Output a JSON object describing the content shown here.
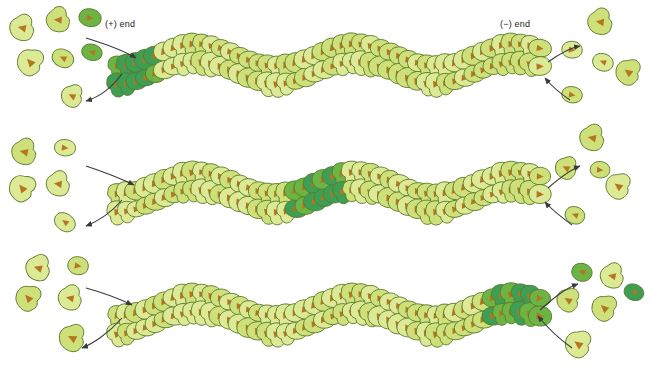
{
  "figure": {
    "type": "biological-process-diagram",
    "panel_count": 3
  },
  "labels": {
    "plus_end": "(+) end",
    "minus_end": "(−) end"
  },
  "colors": {
    "atp_actin_dark": "#3d9e54",
    "atp_actin_mid": "#6cb544",
    "adp_actin_light": "#cde07a",
    "adp_actin_pale": "#dcea96",
    "subunit_outline": "#5c7a2e",
    "barb_arrow": "#b5761f",
    "arrow_stroke": "#3a3a3a",
    "linker": "#9fb6c9",
    "background": "#ffffff",
    "label_text": "#231f20"
  },
  "panels": [
    {
      "id": "panel-1",
      "name": "newly-added-atp-subunits-at-plus-end",
      "y": 12,
      "dark_band": {
        "position": "plus-end",
        "start_index": 0,
        "count": 5
      },
      "filament": {
        "x_start": 118,
        "x_end": 540,
        "subunits": 46
      },
      "left_pool": {
        "name": "free-monomer-pool-left",
        "monomers": [
          {
            "x": 22,
            "y": 28,
            "shape": "pear",
            "state": "adp",
            "rot": 200,
            "s": 1.15
          },
          {
            "x": 58,
            "y": 20,
            "shape": "pear",
            "state": "adp",
            "rot": 190,
            "s": 1.1
          },
          {
            "x": 90,
            "y": 18,
            "shape": "round",
            "state": "atp",
            "rot": 10,
            "s": 0.95
          },
          {
            "x": 30,
            "y": 62,
            "shape": "pear",
            "state": "adp",
            "rot": 235,
            "s": 1.2
          },
          {
            "x": 63,
            "y": 58,
            "shape": "round",
            "state": "adp",
            "rot": 205,
            "s": 0.95
          },
          {
            "x": 92,
            "y": 52,
            "shape": "round",
            "state": "atp",
            "rot": 195,
            "s": 0.9
          },
          {
            "x": 72,
            "y": 96,
            "shape": "pear",
            "state": "adp",
            "rot": 215,
            "s": 1.0
          }
        ]
      },
      "right_pool": {
        "name": "free-monomer-pool-right",
        "monomers": [
          {
            "x": 600,
            "y": 22,
            "shape": "pear",
            "state": "adp",
            "rot": 195,
            "s": 1.15
          },
          {
            "x": 572,
            "y": 50,
            "shape": "round",
            "state": "adp",
            "rot": 5,
            "s": 0.95
          },
          {
            "x": 603,
            "y": 62,
            "shape": "round",
            "state": "adp",
            "rot": 200,
            "s": 0.9
          },
          {
            "x": 628,
            "y": 72,
            "shape": "pear",
            "state": "adp",
            "rot": 225,
            "s": 1.15
          },
          {
            "x": 572,
            "y": 95,
            "shape": "round",
            "state": "adp",
            "rot": 10,
            "s": 0.9
          }
        ]
      },
      "arrows": [
        {
          "name": "association-arrow-plus-end",
          "d": "M86,38 C112,46 126,52 136,58",
          "dir": "in"
        },
        {
          "name": "dissociation-arrow-plus-end",
          "d": "M122,74 C110,90 96,98 86,101",
          "dir": "out"
        },
        {
          "name": "dissociation-arrow-minus-end",
          "d": "M548,62 C562,52 570,48 580,46",
          "dir": "out"
        },
        {
          "name": "association-arrow-minus-end",
          "d": "M570,100 C558,92 550,84 545,78",
          "dir": "in"
        }
      ]
    },
    {
      "id": "panel-2",
      "name": "atp-band-migrated-to-filament-middle",
      "y": 140,
      "dark_band": {
        "position": "middle",
        "start_index": 19,
        "count": 6
      },
      "filament": {
        "x_start": 118,
        "x_end": 540,
        "subunits": 46
      },
      "left_pool": {
        "name": "free-monomer-pool-left",
        "monomers": [
          {
            "x": 24,
            "y": 152,
            "shape": "pear",
            "state": "adp",
            "rot": 200,
            "s": 1.15
          },
          {
            "x": 65,
            "y": 148,
            "shape": "round",
            "state": "adp",
            "rot": 5,
            "s": 0.95
          },
          {
            "x": 22,
            "y": 188,
            "shape": "pear",
            "state": "adp",
            "rot": 240,
            "s": 1.2
          },
          {
            "x": 58,
            "y": 184,
            "shape": "pear",
            "state": "adp",
            "rot": 195,
            "s": 1.1
          },
          {
            "x": 65,
            "y": 222,
            "shape": "round",
            "state": "adp",
            "rot": 215,
            "s": 0.95
          }
        ]
      },
      "right_pool": {
        "name": "free-monomer-pool-right",
        "monomers": [
          {
            "x": 592,
            "y": 138,
            "shape": "pear",
            "state": "adp",
            "rot": 200,
            "s": 1.15
          },
          {
            "x": 566,
            "y": 168,
            "shape": "pear",
            "state": "adp",
            "rot": 215,
            "s": 1.0
          },
          {
            "x": 600,
            "y": 170,
            "shape": "round",
            "state": "adp",
            "rot": 5,
            "s": 0.9
          },
          {
            "x": 618,
            "y": 186,
            "shape": "pear",
            "state": "adp",
            "rot": 225,
            "s": 1.15
          },
          {
            "x": 575,
            "y": 215,
            "shape": "round",
            "state": "adp",
            "rot": 200,
            "s": 0.9
          }
        ]
      },
      "arrows": [
        {
          "name": "association-arrow-plus-end",
          "d": "M86,166 C110,174 124,180 134,185",
          "dir": "in"
        },
        {
          "name": "dissociation-arrow-plus-end",
          "d": "M122,200 C110,214 96,222 86,226",
          "dir": "out"
        },
        {
          "name": "dissociation-arrow-minus-end",
          "d": "M548,188 C562,176 570,170 580,166",
          "dir": "out"
        },
        {
          "name": "association-arrow-minus-end",
          "d": "M572,225 C560,216 550,208 545,202",
          "dir": "in"
        }
      ]
    },
    {
      "id": "panel-3",
      "name": "atp-band-reaches-minus-end-and-dissociates",
      "y": 262,
      "dark_band": {
        "position": "minus-end",
        "start_index": 40,
        "count": 6
      },
      "filament": {
        "x_start": 118,
        "x_end": 540,
        "subunits": 46
      },
      "left_pool": {
        "name": "free-monomer-pool-left",
        "monomers": [
          {
            "x": 38,
            "y": 268,
            "shape": "pear",
            "state": "adp",
            "rot": 205,
            "s": 1.15
          },
          {
            "x": 78,
            "y": 266,
            "shape": "round",
            "state": "adp",
            "rot": 10,
            "s": 0.95
          },
          {
            "x": 28,
            "y": 298,
            "shape": "pear",
            "state": "adp",
            "rot": 235,
            "s": 1.15
          },
          {
            "x": 70,
            "y": 298,
            "shape": "pear",
            "state": "adp",
            "rot": 200,
            "s": 1.1
          },
          {
            "x": 72,
            "y": 338,
            "shape": "pear",
            "state": "adp",
            "rot": 215,
            "s": 1.2
          }
        ]
      },
      "right_pool": {
        "name": "free-monomer-pool-right",
        "monomers": [
          {
            "x": 582,
            "y": 272,
            "shape": "round",
            "state": "atp",
            "rot": 195,
            "s": 0.95
          },
          {
            "x": 612,
            "y": 276,
            "shape": "pear",
            "state": "adp",
            "rot": 200,
            "s": 1.1
          },
          {
            "x": 568,
            "y": 300,
            "shape": "pear",
            "state": "adp",
            "rot": 220,
            "s": 1.05
          },
          {
            "x": 604,
            "y": 308,
            "shape": "pear",
            "state": "adp",
            "rot": 230,
            "s": 1.15
          },
          {
            "x": 634,
            "y": 292,
            "shape": "round",
            "state": "atp",
            "rot": 200,
            "s": 0.9
          },
          {
            "x": 578,
            "y": 344,
            "shape": "pear",
            "state": "adp",
            "rot": 225,
            "s": 1.2
          }
        ]
      },
      "arrows": [
        {
          "name": "association-arrow-plus-end",
          "d": "M86,288 C108,294 122,300 132,305",
          "dir": "in"
        },
        {
          "name": "dissociation-arrow-plus-end",
          "d": "M122,318 C108,334 92,344 82,348",
          "dir": "out"
        },
        {
          "name": "dissociation-arrow-minus-end",
          "d": "M540,310 C556,296 566,288 578,284",
          "dir": "out"
        },
        {
          "name": "association-arrow-minus-end",
          "d": "M572,348 C558,338 546,326 538,316",
          "dir": "in"
        }
      ]
    }
  ]
}
